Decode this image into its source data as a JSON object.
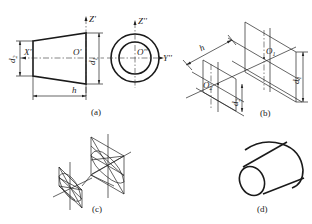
{
  "figure": {
    "panels": [
      {
        "id": "a",
        "caption": "(a)",
        "description": "Orthographic front and side views of a truncated cone",
        "labels": {
          "z_front": "Z'",
          "z_side": "Z''",
          "x_axis": "X'",
          "y_axis": "Y''",
          "origin_front": "O'",
          "origin_side": "O''",
          "small_diameter": "d",
          "small_diameter_sub": "2",
          "large_diameter": "d",
          "large_diameter_sub": "1",
          "height": "h"
        }
      },
      {
        "id": "b",
        "caption": "(b)",
        "description": "Isometric axes with rhombi for end faces",
        "labels": {
          "height": "h",
          "center_1": "O",
          "center_1_sub": "1",
          "center_2": "O",
          "center_2_sub": "2",
          "large_diameter": "d",
          "large_diameter_sub": "1",
          "small_diameter": "d",
          "small_diameter_sub": "2"
        }
      },
      {
        "id": "c",
        "caption": "(c)",
        "description": "Four-center ellipse construction in rhombi"
      },
      {
        "id": "d",
        "caption": "(d)",
        "description": "Completed isometric drawing of truncated cone"
      }
    ]
  }
}
